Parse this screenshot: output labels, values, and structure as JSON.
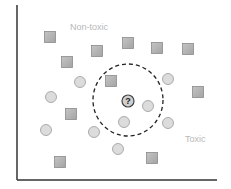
{
  "diagram": {
    "type": "knn-classification-illustration",
    "labels": {
      "non_toxic": "Non-toxic",
      "toxic": "Toxic"
    },
    "query": {
      "symbol": "?",
      "x": 128,
      "y": 101
    },
    "neighborhood": {
      "cx": 128,
      "cy": 100,
      "rx": 35,
      "ry": 36,
      "style": "dashed"
    },
    "colors": {
      "axis": "#333333",
      "square_fill": "#b0b0b0",
      "square_stroke": "#8a8a8a",
      "circle_fill": "#dcdcdc",
      "circle_stroke": "#999999",
      "label": "#b8b8b8",
      "dash": "#222222"
    },
    "squares": [
      {
        "x": 50,
        "y": 37
      },
      {
        "x": 128,
        "y": 43
      },
      {
        "x": 157,
        "y": 48
      },
      {
        "x": 188,
        "y": 49
      },
      {
        "x": 97,
        "y": 51
      },
      {
        "x": 67,
        "y": 62
      },
      {
        "x": 111,
        "y": 81
      },
      {
        "x": 198,
        "y": 92
      },
      {
        "x": 71,
        "y": 114
      },
      {
        "x": 60,
        "y": 162
      },
      {
        "x": 152,
        "y": 158
      }
    ],
    "circles": [
      {
        "x": 80,
        "y": 82
      },
      {
        "x": 168,
        "y": 79
      },
      {
        "x": 51,
        "y": 97
      },
      {
        "x": 148,
        "y": 106
      },
      {
        "x": 124,
        "y": 122
      },
      {
        "x": 168,
        "y": 123
      },
      {
        "x": 46,
        "y": 130
      },
      {
        "x": 94,
        "y": 132
      },
      {
        "x": 118,
        "y": 149
      }
    ]
  }
}
